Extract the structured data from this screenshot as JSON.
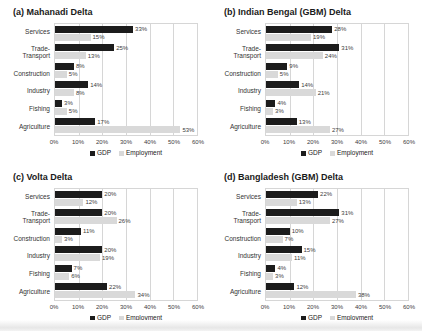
{
  "colors": {
    "gdp_bar": "#1c1c1c",
    "employment_bar": "#d9d9d9",
    "gridline": "#d6d6d6",
    "text": "#1a1a1a",
    "muted_text": "#404040"
  },
  "chart_data": [
    {
      "type": "bar",
      "orientation": "horizontal",
      "title": "(a) Mahanadi Delta",
      "categories": [
        "Services",
        "Trade-Transport",
        "Construction",
        "Industry",
        "Fishing",
        "Agriculture"
      ],
      "series": [
        {
          "name": "GDP",
          "values": [
            33,
            25,
            8,
            14,
            3,
            17
          ]
        },
        {
          "name": "Employment",
          "values": [
            15,
            13,
            5,
            8,
            5,
            53
          ]
        }
      ],
      "value_suffix": "%",
      "xlim": [
        0,
        60
      ],
      "xticks": [
        "0%",
        "10%",
        "20%",
        "30%",
        "40%",
        "50%",
        "60%"
      ],
      "grid": true,
      "legend_position": "bottom"
    },
    {
      "type": "bar",
      "orientation": "horizontal",
      "title": "(b) Indian Bengal (GBM) Delta",
      "categories": [
        "Services",
        "Trade-Transport",
        "Construction",
        "Industry",
        "Fishing",
        "Agriculture"
      ],
      "series": [
        {
          "name": "GDP",
          "values": [
            28,
            31,
            9,
            14,
            4,
            13
          ]
        },
        {
          "name": "Employment",
          "values": [
            19,
            24,
            5,
            21,
            3,
            27
          ]
        }
      ],
      "value_suffix": "%",
      "xlim": [
        0,
        60
      ],
      "xticks": [
        "0%",
        "10%",
        "20%",
        "30%",
        "40%",
        "50%",
        "60%"
      ],
      "grid": true,
      "legend_position": "bottom"
    },
    {
      "type": "bar",
      "orientation": "horizontal",
      "title": "(c) Volta Delta",
      "categories": [
        "Services",
        "Trade-Transport",
        "Construction",
        "Industry",
        "Fishing",
        "Agriculture"
      ],
      "series": [
        {
          "name": "GDP",
          "values": [
            20,
            20,
            11,
            20,
            7,
            22
          ]
        },
        {
          "name": "Employment",
          "values": [
            12,
            26,
            3,
            19,
            6,
            34
          ]
        }
      ],
      "value_suffix": "%",
      "xlim": [
        0,
        60
      ],
      "xticks": [
        "0%",
        "10%",
        "20%",
        "30%",
        "40%",
        "50%",
        "60%"
      ],
      "grid": true,
      "legend_position": "bottom"
    },
    {
      "type": "bar",
      "orientation": "horizontal",
      "title": "(d) Bangladesh (GBM) Delta",
      "categories": [
        "Services",
        "Trade-Transport",
        "Construction",
        "Industry",
        "Fishing",
        "Agriculture"
      ],
      "series": [
        {
          "name": "GDP",
          "values": [
            22,
            31,
            10,
            15,
            4,
            12
          ]
        },
        {
          "name": "Employment",
          "values": [
            13,
            27,
            7,
            11,
            3,
            38
          ]
        }
      ],
      "value_suffix": "%",
      "xlim": [
        0,
        60
      ],
      "xticks": [
        "0%",
        "10%",
        "20%",
        "30%",
        "40%",
        "50%",
        "60%"
      ],
      "grid": true,
      "legend_position": "bottom"
    }
  ]
}
